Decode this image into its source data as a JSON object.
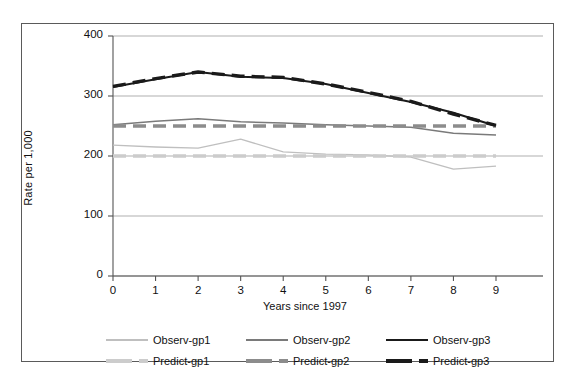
{
  "chart_data": {
    "type": "line",
    "title": "",
    "xlabel": "Years since 1997",
    "ylabel": "Rate per 1,000",
    "x": [
      0,
      1,
      2,
      3,
      4,
      5,
      6,
      7,
      8,
      9
    ],
    "xticklabels": [
      "0",
      "1",
      "2",
      "3",
      "4",
      "5",
      "6",
      "7",
      "8",
      "9"
    ],
    "yticklabels": [
      "0",
      "100",
      "200",
      "300",
      "400"
    ],
    "yticks": [
      0,
      100,
      200,
      300,
      400
    ],
    "xlim": [
      0,
      9
    ],
    "ylim": [
      0,
      400
    ],
    "grid": "horizontal",
    "legend_position": "bottom",
    "series": [
      {
        "name": "Observ-gp1",
        "style": "solid",
        "color": "#bfbfbf",
        "width": 1.3,
        "values": [
          218,
          215,
          213,
          228,
          207,
          203,
          202,
          198,
          178,
          183
        ]
      },
      {
        "name": "Observ-gp2",
        "style": "solid",
        "color": "#7a7a7a",
        "width": 1.5,
        "values": [
          252,
          258,
          262,
          257,
          255,
          252,
          250,
          248,
          238,
          235
        ]
      },
      {
        "name": "Observ-gp3",
        "style": "solid",
        "color": "#1a1a1a",
        "width": 2.0,
        "values": [
          315,
          328,
          340,
          332,
          330,
          320,
          305,
          290,
          272,
          250
        ]
      },
      {
        "name": "Predict-gp1",
        "style": "dashed",
        "color": "#cccccc",
        "width": 3.4,
        "values": [
          200,
          200,
          200,
          200,
          200,
          200,
          200,
          200,
          200,
          200
        ]
      },
      {
        "name": "Predict-gp2",
        "style": "dashed",
        "color": "#8c8c8c",
        "width": 3.4,
        "values": [
          250,
          250,
          250,
          250,
          250,
          250,
          250,
          250,
          250,
          250
        ]
      },
      {
        "name": "Predict-gp3",
        "style": "dashed",
        "color": "#1a1a1a",
        "width": 3.4,
        "values": [
          316,
          329,
          340,
          333,
          331,
          320,
          306,
          291,
          270,
          251
        ]
      }
    ]
  },
  "legend": {
    "rows": [
      [
        "Observ-gp1",
        "Observ-gp2",
        "Observ-gp3"
      ],
      [
        "Predict-gp1",
        "Predict-gp2",
        "Predict-gp3"
      ]
    ],
    "items": [
      {
        "label": "Observ-gp1",
        "color": "#bfbfbf",
        "style": "solid",
        "width": 1.3
      },
      {
        "label": "Observ-gp2",
        "color": "#7a7a7a",
        "style": "solid",
        "width": 1.6
      },
      {
        "label": "Observ-gp3",
        "color": "#1a1a1a",
        "style": "solid",
        "width": 2.2
      },
      {
        "label": "Predict-gp1",
        "color": "#cccccc",
        "style": "dashed",
        "width": 3.2
      },
      {
        "label": "Predict-gp2",
        "color": "#8c8c8c",
        "style": "dashed",
        "width": 3.2
      },
      {
        "label": "Predict-gp3",
        "color": "#1a1a1a",
        "style": "dashed",
        "width": 3.6
      }
    ]
  }
}
